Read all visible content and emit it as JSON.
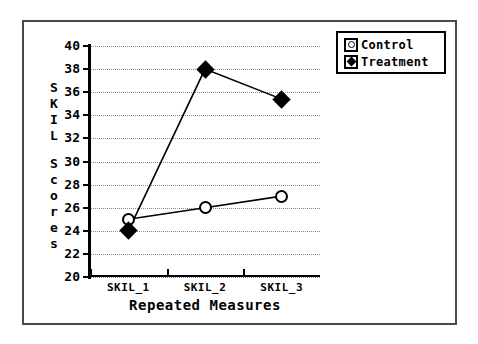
{
  "chart_data": {
    "type": "line",
    "title": "",
    "xlabel": "Repeated Measures",
    "ylabel": "SKILL Scores",
    "ylabel_stack": [
      "S",
      "K",
      "I",
      "L",
      "",
      "S",
      "c",
      "o",
      "r",
      "e",
      "s"
    ],
    "categories": [
      "SKIL_1",
      "SKIL_2",
      "SKIL_3"
    ],
    "series": [
      {
        "name": "Control",
        "marker": "open-circle",
        "values": [
          25,
          26,
          27
        ]
      },
      {
        "name": "Treatment",
        "marker": "filled-diamond",
        "values": [
          24,
          38,
          35.4
        ]
      }
    ],
    "ylim": [
      20,
      40
    ],
    "yticks": [
      40,
      38,
      36,
      34,
      32,
      30,
      28,
      26,
      24,
      22,
      20
    ],
    "grid": true,
    "grid_style": "dotted-horizontal",
    "legend_position": "top-right",
    "colors": {
      "axis": "#000000",
      "grid": "#8a8a8a",
      "marker": "#000000",
      "frame": "#4a4a4a"
    }
  },
  "legend": {
    "entries": [
      {
        "label": "Control",
        "key": "open-circle-key"
      },
      {
        "label": "Treatment",
        "key": "filled-diamond-key"
      }
    ]
  }
}
